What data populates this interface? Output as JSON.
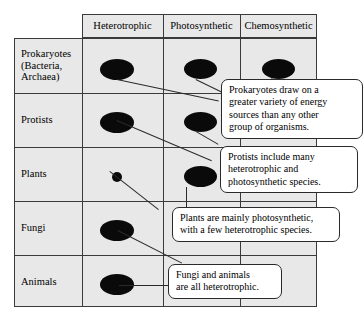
{
  "figure": {
    "name": "energy-source-by-organism-group-table",
    "colors": {
      "cell_fill": "#e8e8e8",
      "grid_line": "#3a3a3a",
      "marker": "#0a0a0a",
      "callout_border": "#2a2a2a",
      "callout_fill": "#ffffff",
      "page_background": "#ffffff"
    }
  },
  "table": {
    "columns": [
      {
        "key": "heterotrophic",
        "label": "Heterotrophic"
      },
      {
        "key": "photosynthetic",
        "label": "Photosynthetic"
      },
      {
        "key": "chemosynthetic",
        "label": "Chemosynthetic"
      }
    ],
    "rows": [
      {
        "key": "prokaryotes",
        "label_lines": [
          "Prokaryotes",
          "(Bacteria,",
          "Archaea)"
        ],
        "markers": {
          "heterotrophic": "large",
          "photosynthetic": "large",
          "chemosynthetic": "large"
        }
      },
      {
        "key": "protists",
        "label_lines": [
          "Protists"
        ],
        "markers": {
          "heterotrophic": "large",
          "photosynthetic": "large",
          "chemosynthetic": "none"
        }
      },
      {
        "key": "plants",
        "label_lines": [
          "Plants"
        ],
        "markers": {
          "heterotrophic": "small",
          "photosynthetic": "large",
          "chemosynthetic": "none"
        }
      },
      {
        "key": "fungi",
        "label_lines": [
          "Fungi"
        ],
        "markers": {
          "heterotrophic": "large",
          "photosynthetic": "none",
          "chemosynthetic": "none"
        }
      },
      {
        "key": "animals",
        "label_lines": [
          "Animals"
        ],
        "markers": {
          "heterotrophic": "large",
          "photosynthetic": "none",
          "chemosynthetic": "none"
        }
      }
    ]
  },
  "callouts": [
    {
      "key": "prokaryotes-note",
      "lines": [
        "Prokaryotes draw on a",
        "greater variety of energy",
        "sources than any other",
        "group of organisms."
      ]
    },
    {
      "key": "protists-note",
      "lines": [
        "Protists include many",
        "heterotrophic and",
        "photosynthetic species."
      ]
    },
    {
      "key": "plants-note",
      "lines": [
        "Plants are mainly photosynthetic,",
        "with a few heterotrophic species."
      ]
    },
    {
      "key": "fungi-animals-note",
      "lines": [
        "Fungi and animals",
        "are all heterotrophic."
      ]
    }
  ]
}
